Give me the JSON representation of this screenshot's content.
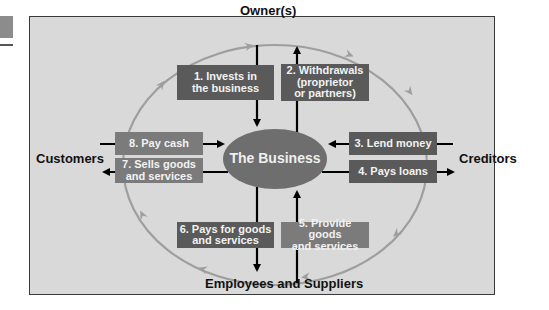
{
  "diagram": {
    "title": "The Business",
    "nodes": {
      "top": "Owner(s)",
      "left": "Customers",
      "right": "Creditors",
      "bottom": "Employees and Suppliers",
      "center": "The Business"
    },
    "flows": [
      {
        "id": 1,
        "lines": [
          "1. Invests in",
          "the business"
        ],
        "from": "Owner(s)",
        "to": "The Business"
      },
      {
        "id": 2,
        "lines": [
          "2. Withdrawals",
          "(proprietor",
          "or partners)"
        ],
        "from": "The Business",
        "to": "Owner(s)"
      },
      {
        "id": 3,
        "lines": [
          "3. Lend money"
        ],
        "from": "Creditors",
        "to": "The Business"
      },
      {
        "id": 4,
        "lines": [
          "4. Pays loans"
        ],
        "from": "The Business",
        "to": "Creditors"
      },
      {
        "id": 5,
        "lines": [
          "5. Provide goods",
          "and services"
        ],
        "from": "Employees and Suppliers",
        "to": "The Business"
      },
      {
        "id": 6,
        "lines": [
          "6. Pays for goods",
          "and services"
        ],
        "from": "The Business",
        "to": "Employees and Suppliers"
      },
      {
        "id": 7,
        "lines": [
          "7. Sells goods",
          "and services"
        ],
        "from": "The Business",
        "to": "Customers"
      },
      {
        "id": 8,
        "lines": [
          "8. Pay cash"
        ],
        "from": "Customers",
        "to": "The Business"
      }
    ],
    "cycle_direction": "clockwise",
    "colors": {
      "background": "#d9d9d9",
      "frame_border": "#3a3a3a",
      "box_dark": "#5a5a5a",
      "box_light": "#7b7b7b",
      "ellipse": "#6e6e6e",
      "cycle_arrow": "#9e9e9e",
      "flow_arrow": "#000000"
    }
  }
}
